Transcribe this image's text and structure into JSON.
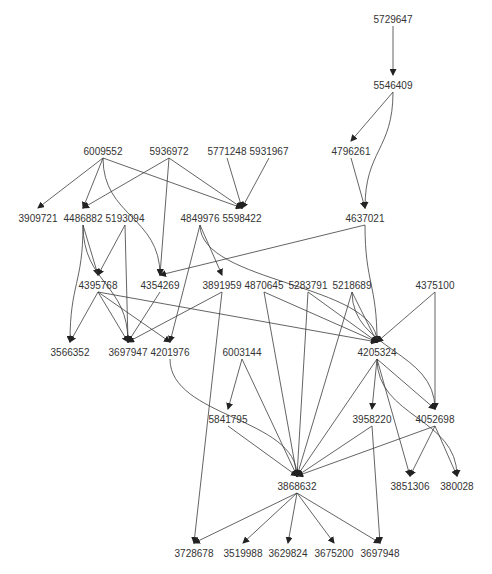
{
  "diagram": {
    "type": "directed-graph",
    "colors": {
      "edge": "#3c3c3c",
      "label": "#333333",
      "background": "#ffffff"
    },
    "nodes": [
      {
        "id": "5729647",
        "label": "5729647",
        "x": 393,
        "y": 20
      },
      {
        "id": "5546409",
        "label": "5546409",
        "x": 393,
        "y": 86
      },
      {
        "id": "4796261",
        "label": "4796261",
        "x": 351,
        "y": 152
      },
      {
        "id": "6009552",
        "label": "6009552",
        "x": 103,
        "y": 152
      },
      {
        "id": "5936972",
        "label": "5936972",
        "x": 169,
        "y": 152
      },
      {
        "id": "5771248",
        "label": "5771248",
        "x": 227,
        "y": 152
      },
      {
        "id": "5931967",
        "label": "5931967",
        "x": 269,
        "y": 152
      },
      {
        "id": "3909721",
        "label": "3909721",
        "x": 38,
        "y": 219
      },
      {
        "id": "4486882",
        "label": "4486882",
        "x": 83,
        "y": 219
      },
      {
        "id": "5193094",
        "label": "5193094",
        "x": 125,
        "y": 219
      },
      {
        "id": "4849976",
        "label": "4849976",
        "x": 200,
        "y": 219
      },
      {
        "id": "5598422",
        "label": "5598422",
        "x": 242,
        "y": 219
      },
      {
        "id": "4637021",
        "label": "4637021",
        "x": 365,
        "y": 219
      },
      {
        "id": "4395768",
        "label": "4395768",
        "x": 98,
        "y": 286
      },
      {
        "id": "4354269",
        "label": "4354269",
        "x": 160,
        "y": 286
      },
      {
        "id": "3891959",
        "label": "3891959",
        "x": 222,
        "y": 286
      },
      {
        "id": "4870645",
        "label": "4870645",
        "x": 264,
        "y": 286
      },
      {
        "id": "5283791",
        "label": "5283791",
        "x": 308,
        "y": 286
      },
      {
        "id": "5218689",
        "label": "5218689",
        "x": 352,
        "y": 286
      },
      {
        "id": "4375100",
        "label": "4375100",
        "x": 435,
        "y": 286
      },
      {
        "id": "3566352",
        "label": "3566352",
        "x": 70,
        "y": 353
      },
      {
        "id": "3697947",
        "label": "3697947",
        "x": 128,
        "y": 353
      },
      {
        "id": "4201976",
        "label": "4201976",
        "x": 170,
        "y": 353
      },
      {
        "id": "6003144",
        "label": "6003144",
        "x": 242,
        "y": 353
      },
      {
        "id": "4205324",
        "label": "4205324",
        "x": 377,
        "y": 353
      },
      {
        "id": "5841795",
        "label": "5841795",
        "x": 228,
        "y": 420
      },
      {
        "id": "3958220",
        "label": "3958220",
        "x": 372,
        "y": 420
      },
      {
        "id": "4052698",
        "label": "4052698",
        "x": 435,
        "y": 420
      },
      {
        "id": "3868632",
        "label": "3868632",
        "x": 297,
        "y": 487
      },
      {
        "id": "3851306",
        "label": "3851306",
        "x": 410,
        "y": 487
      },
      {
        "id": "380028",
        "label": "380028",
        "x": 457,
        "y": 487
      },
      {
        "id": "3728678",
        "label": "3728678",
        "x": 194,
        "y": 554
      },
      {
        "id": "3519988",
        "label": "3519988",
        "x": 243,
        "y": 554
      },
      {
        "id": "3629824",
        "label": "3629824",
        "x": 288,
        "y": 554
      },
      {
        "id": "3675200",
        "label": "3675200",
        "x": 334,
        "y": 554
      },
      {
        "id": "3697948",
        "label": "3697948",
        "x": 380,
        "y": 554
      }
    ],
    "edges": [
      {
        "from": "5729647",
        "to": "5546409"
      },
      {
        "from": "5546409",
        "to": "4796261"
      },
      {
        "from": "5546409",
        "to": "4637021",
        "curve": true
      },
      {
        "from": "4796261",
        "to": "4637021"
      },
      {
        "from": "6009552",
        "to": "3909721"
      },
      {
        "from": "6009552",
        "to": "4486882"
      },
      {
        "from": "6009552",
        "to": "5598422"
      },
      {
        "from": "6009552",
        "to": "4354269",
        "curve": true
      },
      {
        "from": "5936972",
        "to": "4486882"
      },
      {
        "from": "5936972",
        "to": "4354269"
      },
      {
        "from": "5936972",
        "to": "5598422"
      },
      {
        "from": "5771248",
        "to": "5598422"
      },
      {
        "from": "5931967",
        "to": "5598422"
      },
      {
        "from": "4486882",
        "to": "4395768"
      },
      {
        "from": "4486882",
        "to": "3566352",
        "curve": true
      },
      {
        "from": "4486882",
        "to": "3697947",
        "curve": true
      },
      {
        "from": "5193094",
        "to": "4395768"
      },
      {
        "from": "5193094",
        "to": "3697947"
      },
      {
        "from": "4849976",
        "to": "3891959"
      },
      {
        "from": "4849976",
        "to": "4201976"
      },
      {
        "from": "4849976",
        "to": "4205324",
        "curve": true
      },
      {
        "from": "4637021",
        "to": "4354269"
      },
      {
        "from": "4637021",
        "to": "4205324",
        "curve": true
      },
      {
        "from": "4395768",
        "to": "3566352"
      },
      {
        "from": "4395768",
        "to": "3697947"
      },
      {
        "from": "4395768",
        "to": "4201976"
      },
      {
        "from": "4395768",
        "to": "4205324"
      },
      {
        "from": "4354269",
        "to": "3697947"
      },
      {
        "from": "3891959",
        "to": "3697947"
      },
      {
        "from": "3891959",
        "to": "3728678"
      },
      {
        "from": "4870645",
        "to": "4205324"
      },
      {
        "from": "4870645",
        "to": "3868632"
      },
      {
        "from": "5283791",
        "to": "4205324"
      },
      {
        "from": "5283791",
        "to": "3868632"
      },
      {
        "from": "5218689",
        "to": "4205324"
      },
      {
        "from": "5218689",
        "to": "3868632"
      },
      {
        "from": "5218689",
        "to": "4052698",
        "curve": true
      },
      {
        "from": "4375100",
        "to": "4205324"
      },
      {
        "from": "4375100",
        "to": "4052698"
      },
      {
        "from": "4201976",
        "to": "3868632",
        "curve": true
      },
      {
        "from": "6003144",
        "to": "5841795"
      },
      {
        "from": "6003144",
        "to": "3868632"
      },
      {
        "from": "4205324",
        "to": "3868632"
      },
      {
        "from": "4205324",
        "to": "3958220"
      },
      {
        "from": "4205324",
        "to": "4052698"
      },
      {
        "from": "4205324",
        "to": "3851306"
      },
      {
        "from": "4205324",
        "to": "380028",
        "curve": true
      },
      {
        "from": "5841795",
        "to": "3868632"
      },
      {
        "from": "3958220",
        "to": "3868632"
      },
      {
        "from": "3958220",
        "to": "3697948"
      },
      {
        "from": "4052698",
        "to": "3868632"
      },
      {
        "from": "4052698",
        "to": "3851306"
      },
      {
        "from": "4052698",
        "to": "380028"
      },
      {
        "from": "3868632",
        "to": "3728678"
      },
      {
        "from": "3868632",
        "to": "3519988"
      },
      {
        "from": "3868632",
        "to": "3629824"
      },
      {
        "from": "3868632",
        "to": "3675200"
      },
      {
        "from": "3868632",
        "to": "3697948"
      }
    ]
  }
}
